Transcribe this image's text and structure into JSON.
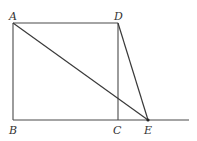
{
  "figure": {
    "points": {
      "A": {
        "label": "A",
        "x": 13,
        "y": 23,
        "label_x": 9,
        "label_y": 20
      },
      "B": {
        "label": "B",
        "x": 13,
        "y": 120,
        "label_x": 9,
        "label_y": 134
      },
      "C": {
        "label": "C",
        "x": 118,
        "y": 120,
        "label_x": 113,
        "label_y": 134
      },
      "D": {
        "label": "D",
        "x": 118,
        "y": 23,
        "label_x": 114,
        "label_y": 20
      },
      "E": {
        "label": "E",
        "x": 148,
        "y": 120,
        "label_x": 144,
        "label_y": 134
      }
    },
    "segments": [
      {
        "name": "AB",
        "from": "A",
        "to": "B"
      },
      {
        "name": "AD",
        "from": "A",
        "to": "D"
      },
      {
        "name": "DC",
        "from": "D",
        "to": "C"
      },
      {
        "name": "AE",
        "from": "A",
        "to": "E"
      },
      {
        "name": "DE",
        "from": "D",
        "to": "E"
      }
    ],
    "baseline": {
      "from_x": 13,
      "to_x": 189,
      "y": 120
    }
  }
}
